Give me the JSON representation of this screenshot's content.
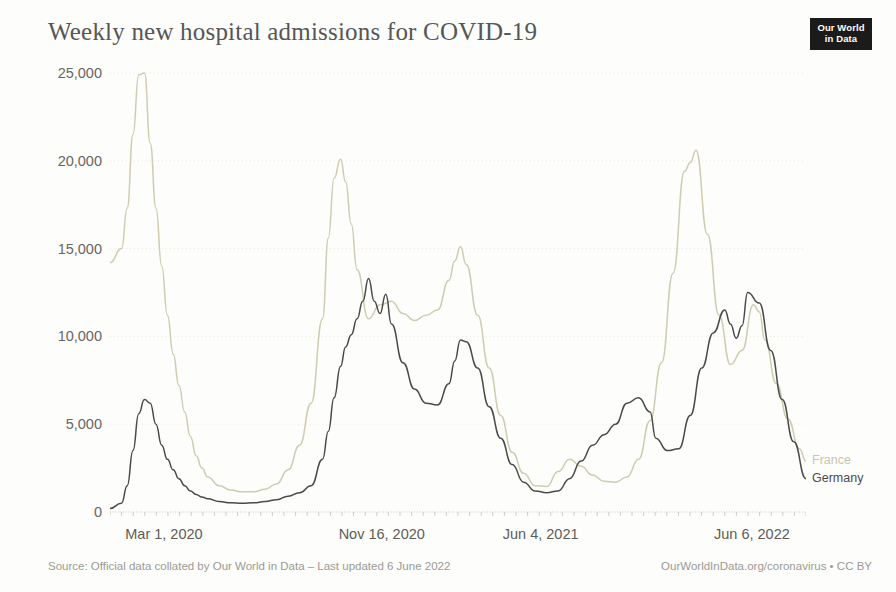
{
  "header": {
    "title": "Weekly new hospital admissions for COVID-19",
    "logo_line1": "Our World",
    "logo_line2": "in Data"
  },
  "footer": {
    "source": "Source: Official data collated by Our World in Data – Last updated 6 June 2022",
    "link": "OurWorldInData.org/coronavirus • CC BY"
  },
  "colors": {
    "france": "#cfccb0",
    "germany": "#4a4a48",
    "axis": "#bdbcb4",
    "grid": "#e8e7e0",
    "text": "#5d5c57",
    "background": "#fdfdfc"
  },
  "chart_data": {
    "type": "line",
    "title": "Weekly new hospital admissions for COVID-19",
    "xlabel": "",
    "ylabel": "",
    "ylim": [
      0,
      25000
    ],
    "yticks": [
      0,
      5000,
      10000,
      15000,
      20000,
      25000
    ],
    "ytick_labels": [
      "0",
      "5,000",
      "10,000",
      "15,000",
      "20,000",
      "25,000"
    ],
    "grid": true,
    "legend_position": "right-end-labels",
    "x_axis_type": "date",
    "xlim": [
      "2020-02-09",
      "2022-06-06"
    ],
    "xticks": [
      "2020-03-01",
      "2020-11-16",
      "2021-06-04",
      "2022-06-06"
    ],
    "xtick_labels": [
      "Mar 1, 2020",
      "Nov 16, 2020",
      "Jun 4, 2021",
      "Jun 6, 2022"
    ],
    "series": [
      {
        "name": "France",
        "color": "#cfccb0",
        "x": [
          "2020-02-09",
          "2020-02-23",
          "2020-03-01",
          "2020-03-08",
          "2020-03-15",
          "2020-03-22",
          "2020-03-29",
          "2020-04-05",
          "2020-04-12",
          "2020-04-19",
          "2020-04-26",
          "2020-05-03",
          "2020-05-10",
          "2020-05-17",
          "2020-05-24",
          "2020-05-31",
          "2020-06-07",
          "2020-06-21",
          "2020-07-05",
          "2020-07-19",
          "2020-08-02",
          "2020-08-16",
          "2020-08-30",
          "2020-09-13",
          "2020-09-27",
          "2020-10-11",
          "2020-10-25",
          "2020-11-01",
          "2020-11-08",
          "2020-11-16",
          "2020-11-22",
          "2020-11-29",
          "2020-12-06",
          "2020-12-20",
          "2021-01-03",
          "2021-01-17",
          "2021-01-31",
          "2021-02-14",
          "2021-02-28",
          "2021-03-14",
          "2021-03-28",
          "2021-04-04",
          "2021-04-11",
          "2021-04-18",
          "2021-05-02",
          "2021-05-16",
          "2021-05-30",
          "2021-06-13",
          "2021-06-27",
          "2021-07-11",
          "2021-07-25",
          "2021-08-08",
          "2021-08-22",
          "2021-09-05",
          "2021-09-19",
          "2021-10-03",
          "2021-10-17",
          "2021-10-31",
          "2021-11-14",
          "2021-11-28",
          "2021-12-12",
          "2021-12-26",
          "2022-01-09",
          "2022-01-16",
          "2022-01-23",
          "2022-02-06",
          "2022-02-20",
          "2022-03-06",
          "2022-03-20",
          "2022-04-03",
          "2022-04-10",
          "2022-04-17",
          "2022-05-01",
          "2022-05-15",
          "2022-05-29",
          "2022-06-06"
        ],
        "y": [
          14200,
          15000,
          17300,
          21500,
          24900,
          25000,
          21000,
          17300,
          14000,
          11200,
          9000,
          7200,
          5700,
          4300,
          3200,
          2500,
          2000,
          1500,
          1250,
          1150,
          1150,
          1300,
          1600,
          2400,
          3800,
          6200,
          11000,
          15600,
          19000,
          20100,
          18800,
          16400,
          13800,
          11000,
          11800,
          12000,
          11300,
          10900,
          11200,
          11500,
          13200,
          14300,
          15100,
          14100,
          11200,
          8200,
          5500,
          3400,
          2200,
          1500,
          1450,
          2300,
          3000,
          2600,
          2100,
          1750,
          1700,
          2000,
          3000,
          5200,
          8500,
          13600,
          19400,
          19900,
          20600,
          15800,
          11200,
          8400,
          9200,
          11800,
          11400,
          9800,
          7300,
          5300,
          3600,
          2900
        ],
        "peaks": [
          {
            "date": "2020-03-22",
            "value": 25000
          },
          {
            "date": "2020-11-16",
            "value": 20100
          },
          {
            "date": "2021-04-11",
            "value": 15100
          },
          {
            "date": "2022-01-23",
            "value": 20600
          }
        ]
      },
      {
        "name": "Germany",
        "color": "#4a4a48",
        "x": [
          "2020-02-09",
          "2020-02-23",
          "2020-03-01",
          "2020-03-08",
          "2020-03-15",
          "2020-03-22",
          "2020-03-29",
          "2020-04-05",
          "2020-04-12",
          "2020-04-19",
          "2020-04-26",
          "2020-05-03",
          "2020-05-10",
          "2020-05-17",
          "2020-05-24",
          "2020-05-31",
          "2020-06-07",
          "2020-06-21",
          "2020-07-05",
          "2020-07-19",
          "2020-08-02",
          "2020-08-16",
          "2020-08-30",
          "2020-09-13",
          "2020-09-27",
          "2020-10-11",
          "2020-10-25",
          "2020-11-01",
          "2020-11-08",
          "2020-11-16",
          "2020-11-22",
          "2020-11-29",
          "2020-12-06",
          "2020-12-13",
          "2020-12-20",
          "2020-12-27",
          "2021-01-03",
          "2021-01-10",
          "2021-01-17",
          "2021-01-31",
          "2021-02-14",
          "2021-02-28",
          "2021-03-14",
          "2021-03-28",
          "2021-04-04",
          "2021-04-11",
          "2021-04-18",
          "2021-05-02",
          "2021-05-16",
          "2021-05-30",
          "2021-06-13",
          "2021-06-27",
          "2021-07-11",
          "2021-07-25",
          "2021-08-08",
          "2021-08-22",
          "2021-09-05",
          "2021-09-19",
          "2021-10-03",
          "2021-10-17",
          "2021-10-31",
          "2021-11-14",
          "2021-11-28",
          "2021-12-05",
          "2021-12-19",
          "2022-01-02",
          "2022-01-16",
          "2022-01-30",
          "2022-02-13",
          "2022-02-27",
          "2022-03-06",
          "2022-03-13",
          "2022-03-20",
          "2022-03-27",
          "2022-04-10",
          "2022-04-24",
          "2022-05-08",
          "2022-05-22",
          "2022-06-06"
        ],
        "y": [
          200,
          500,
          1500,
          3500,
          5600,
          6400,
          6200,
          5000,
          3800,
          3000,
          2400,
          1900,
          1500,
          1200,
          1000,
          850,
          750,
          600,
          520,
          500,
          520,
          600,
          700,
          900,
          1100,
          1500,
          3000,
          4600,
          6500,
          8300,
          9400,
          10100,
          11000,
          12000,
          13300,
          12000,
          11300,
          12400,
          10700,
          8500,
          7000,
          6200,
          6100,
          7300,
          8600,
          9800,
          9700,
          8200,
          6000,
          4200,
          2700,
          1700,
          1200,
          1100,
          1200,
          1900,
          2900,
          3800,
          4400,
          5000,
          6200,
          6500,
          5700,
          4200,
          3500,
          3600,
          5500,
          8200,
          10200,
          11500,
          10700,
          9900,
          10600,
          12500,
          11900,
          9200,
          6400,
          4000,
          1900
        ],
        "peaks": [
          {
            "date": "2020-03-22",
            "value": 6400
          },
          {
            "date": "2020-12-20",
            "value": 13300
          },
          {
            "date": "2021-04-11",
            "value": 9800
          },
          {
            "date": "2021-11-28",
            "value": 6500
          },
          {
            "date": "2022-03-27",
            "value": 12500
          }
        ]
      }
    ]
  },
  "series_labels": {
    "france": "France",
    "germany": "Germany"
  }
}
